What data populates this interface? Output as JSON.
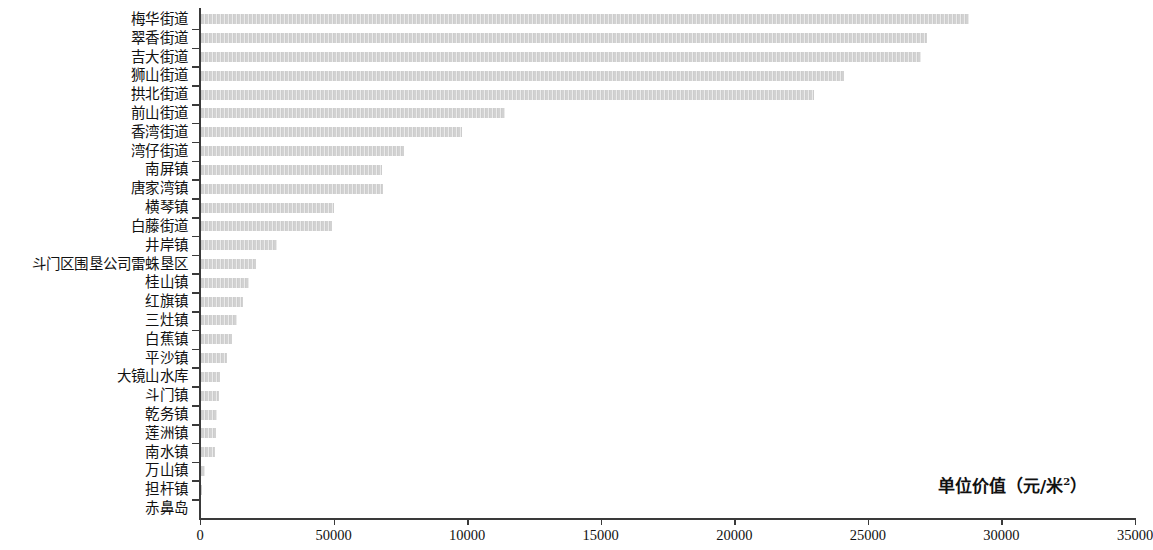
{
  "chart_data": {
    "type": "bar",
    "orientation": "horizontal",
    "title": "",
    "xlabel": "单位价值（元/米²）",
    "ylabel": "",
    "xlim": [
      0,
      35000
    ],
    "grid": false,
    "legend": null,
    "bar_color": "#d2d2d2",
    "axis_color": "#3a3a3a",
    "x_ticks": [
      {
        "value": 0,
        "label": "0"
      },
      {
        "value": 5000,
        "label": "50000"
      },
      {
        "value": 10000,
        "label": "10000"
      },
      {
        "value": 15000,
        "label": "15000"
      },
      {
        "value": 20000,
        "label": "20000"
      },
      {
        "value": 25000,
        "label": "25000"
      },
      {
        "value": 30000,
        "label": "30000"
      },
      {
        "value": 35000,
        "label": "35000"
      }
    ],
    "categories": [
      "梅华街道",
      "翠香街道",
      "吉大街道",
      "狮山街道",
      "拱北街道",
      "前山街道",
      "香湾街道",
      "湾仔街道",
      "南屏镇",
      "唐家湾镇",
      "横琴镇",
      "白藤街道",
      "井岸镇",
      "斗门区围垦公司雷蛛垦区",
      "桂山镇",
      "红旗镇",
      "三灶镇",
      "白蕉镇",
      "平沙镇",
      "大镜山水库",
      "斗门镇",
      "乾务镇",
      "莲洲镇",
      "南水镇",
      "万山镇",
      "担杆镇",
      "赤鼻岛"
    ],
    "values": [
      28800,
      27200,
      27000,
      24100,
      23000,
      11400,
      9800,
      7650,
      6800,
      6850,
      5000,
      4950,
      2900,
      2080,
      1850,
      1620,
      1380,
      1200,
      1010,
      760,
      720,
      640,
      600,
      560,
      200,
      90,
      0
    ]
  }
}
